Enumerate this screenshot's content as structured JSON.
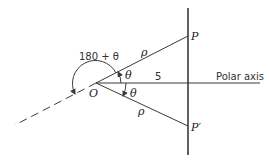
{
  "diagram": {
    "type": "polar-coordinates-symmetry",
    "labels": {
      "origin": "O",
      "point_p": "P",
      "point_p_prime": "P′",
      "rho_upper": "ρ",
      "rho_lower": "ρ",
      "theta_upper": "θ",
      "theta_lower": "θ",
      "angle_outer": "180 + θ",
      "distance": "5",
      "polar_axis": "Polar axis"
    },
    "geometry": {
      "origin": [
        96,
        83
      ],
      "vertical_line_x": 188,
      "vertical_line_range": [
        8,
        155
      ],
      "p": [
        188,
        36
      ],
      "p_prime": [
        188,
        126
      ],
      "polar_axis_end": [
        260,
        83
      ],
      "dashed_end": [
        15,
        125
      ]
    },
    "colors": {
      "stroke": "#3a3a3a",
      "text": "#222222",
      "background": "#ffffff"
    }
  }
}
